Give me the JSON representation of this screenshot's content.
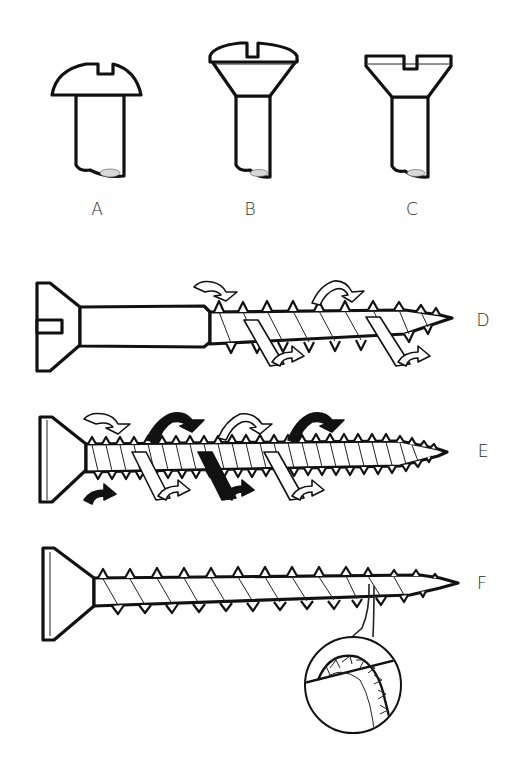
{
  "figure": {
    "labels": {
      "a": "A",
      "b": "B",
      "c": "C",
      "d": "D",
      "e": "E",
      "f": "F"
    }
  },
  "items": [
    {
      "id": "A",
      "depicts": "round-head slotted screw (head detail)"
    },
    {
      "id": "B",
      "depicts": "raised countersunk (oval) head slotted screw (head detail)"
    },
    {
      "id": "C",
      "depicts": "countersunk flat-head slotted screw (head detail)"
    },
    {
      "id": "D",
      "depicts": "slotted countersunk wood screw with single thread and rotation arrows"
    },
    {
      "id": "E",
      "depicts": "twin-thread countersunk screw with double rotation arrows (black and white)"
    },
    {
      "id": "F",
      "depicts": "self-tapping countersunk screw with serrated thread magnified inset"
    }
  ],
  "colors": {
    "ink": "#111111",
    "paper": "#ffffff"
  }
}
